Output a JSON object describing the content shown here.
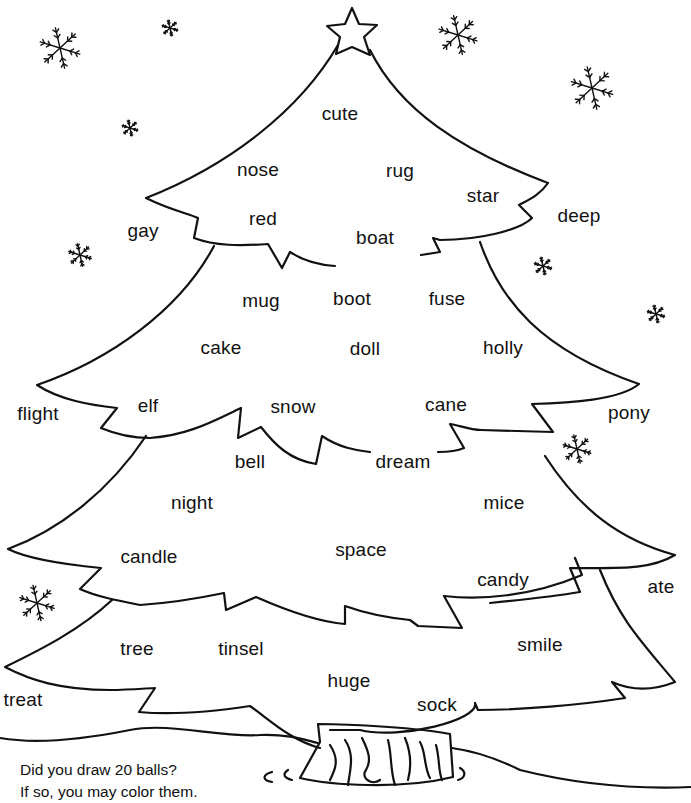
{
  "worksheet": {
    "instructions": {
      "line1": "Did you draw 20 balls?",
      "line2": "If so, you may color them."
    },
    "words_on_tree": [
      {
        "text": "cute",
        "x": 340,
        "y": 113
      },
      {
        "text": "nose",
        "x": 258,
        "y": 169
      },
      {
        "text": "rug",
        "x": 400,
        "y": 170
      },
      {
        "text": "star",
        "x": 483,
        "y": 195
      },
      {
        "text": "red",
        "x": 263,
        "y": 218
      },
      {
        "text": "boat",
        "x": 375,
        "y": 237
      },
      {
        "text": "mug",
        "x": 261,
        "y": 300
      },
      {
        "text": "boot",
        "x": 352,
        "y": 298
      },
      {
        "text": "fuse",
        "x": 447,
        "y": 298
      },
      {
        "text": "cake",
        "x": 221,
        "y": 347
      },
      {
        "text": "doll",
        "x": 365,
        "y": 348
      },
      {
        "text": "holly",
        "x": 503,
        "y": 347
      },
      {
        "text": "elf",
        "x": 148,
        "y": 405
      },
      {
        "text": "snow",
        "x": 293,
        "y": 406
      },
      {
        "text": "cane",
        "x": 446,
        "y": 404
      },
      {
        "text": "bell",
        "x": 250,
        "y": 461
      },
      {
        "text": "dream",
        "x": 403,
        "y": 461
      },
      {
        "text": "night",
        "x": 192,
        "y": 502
      },
      {
        "text": "mice",
        "x": 504,
        "y": 502
      },
      {
        "text": "candle",
        "x": 149,
        "y": 556
      },
      {
        "text": "space",
        "x": 361,
        "y": 549
      },
      {
        "text": "candy",
        "x": 503,
        "y": 579
      },
      {
        "text": "tree",
        "x": 137,
        "y": 648
      },
      {
        "text": "tinsel",
        "x": 241,
        "y": 648
      },
      {
        "text": "smile",
        "x": 540,
        "y": 644
      },
      {
        "text": "huge",
        "x": 349,
        "y": 680
      },
      {
        "text": "sock",
        "x": 437,
        "y": 704
      }
    ],
    "words_off_tree": [
      {
        "text": "gay",
        "x": 143,
        "y": 230
      },
      {
        "text": "deep",
        "x": 579,
        "y": 215
      },
      {
        "text": "flight",
        "x": 38,
        "y": 413
      },
      {
        "text": "pony",
        "x": 629,
        "y": 412
      },
      {
        "text": "ate",
        "x": 661,
        "y": 586
      },
      {
        "text": "treat",
        "x": 23,
        "y": 699
      }
    ],
    "decorations": {
      "star_icon": "tree-top-star",
      "snowflakes": [
        {
          "x": 60,
          "y": 50,
          "size": 46
        },
        {
          "x": 170,
          "y": 30,
          "size": 18
        },
        {
          "x": 130,
          "y": 130,
          "size": 18
        },
        {
          "x": 80,
          "y": 257,
          "size": 26
        },
        {
          "x": 458,
          "y": 37,
          "size": 44
        },
        {
          "x": 592,
          "y": 90,
          "size": 48
        },
        {
          "x": 543,
          "y": 268,
          "size": 20
        },
        {
          "x": 656,
          "y": 316,
          "size": 20
        },
        {
          "x": 577,
          "y": 451,
          "size": 32
        },
        {
          "x": 37,
          "y": 605,
          "size": 40
        }
      ]
    },
    "colors": {
      "ink": "#111111",
      "paper": "#ffffff"
    }
  }
}
